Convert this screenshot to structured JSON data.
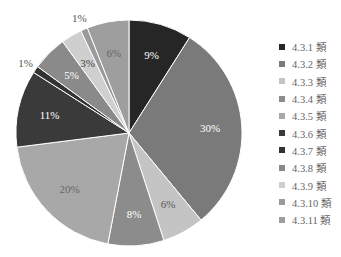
{
  "chart_data": {
    "type": "pie",
    "title": "",
    "start_angle_deg": 0,
    "direction": "clockwise",
    "categories": [
      "4.3.1 類",
      "4.3.2 類",
      "4.3.3 類",
      "4.3.4 類",
      "4.3.5 類",
      "4.3.6 類",
      "4.3.7 類",
      "4.3.8 類",
      "4.3.9 類",
      "4.3.10 類",
      "4.3.11 類"
    ],
    "values": [
      9,
      30,
      6,
      8,
      20,
      11,
      1,
      5,
      3,
      1,
      6
    ],
    "labels": [
      "9%",
      "30%",
      "6%",
      "8%",
      "20%",
      "11%",
      "1%",
      "5%",
      "3%",
      "1%",
      "6%"
    ],
    "colors": [
      "#262626",
      "#7a7a7a",
      "#c4c4c4",
      "#8c8c8c",
      "#a8a8a8",
      "#3a3a3a",
      "#333333",
      "#8a8a8a",
      "#cfcfcf",
      "#9a9a9a",
      "#9e9e9e"
    ],
    "label_colors": [
      "#ffffff",
      "#ffffff",
      "#555555",
      "#ffffff",
      "#666666",
      "#ffffff",
      "#555555",
      "#ffffff",
      "#444444",
      "#555555",
      "#666666"
    ],
    "legend_position": "right"
  }
}
